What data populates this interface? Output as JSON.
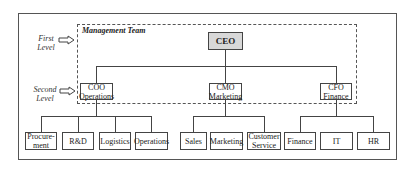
{
  "levels": {
    "first": "First Level",
    "first_line1": "First",
    "first_line2": "Level",
    "second_line1": "Second",
    "second_line2": "Level"
  },
  "management_team_label": "Management Team",
  "ceo": "CEO",
  "executives": [
    {
      "title": "COO",
      "area": "Operations"
    },
    {
      "title": "CMO",
      "area": "Marketing"
    },
    {
      "title": "CFO",
      "area": "Finance"
    }
  ],
  "departments": {
    "coo": [
      {
        "line1": "Procure-",
        "line2": "ment"
      },
      {
        "line1": "R&D"
      },
      {
        "line1": "Logistics"
      },
      {
        "line1": "Operations"
      }
    ],
    "cmo": [
      {
        "line1": "Sales"
      },
      {
        "line1": "Marketing"
      },
      {
        "line1": "Customer",
        "line2": "Service"
      }
    ],
    "cfo": [
      {
        "line1": "Finance"
      },
      {
        "line1": "IT"
      },
      {
        "line1": "HR"
      }
    ]
  },
  "colors": {
    "ceo_fill": "#d8d8d8",
    "lines": "#444444"
  }
}
